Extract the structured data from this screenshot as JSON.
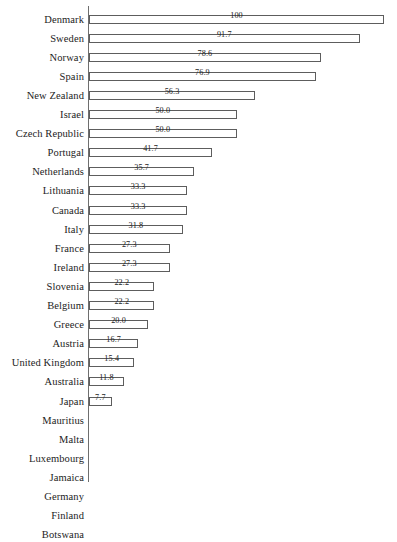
{
  "chart": {
    "type": "bar",
    "orientation": "horizontal",
    "background_color": "#ffffff",
    "bar_fill_color": "#ffffff",
    "bar_border_color": "#5d5d5d",
    "axis_color": "#6e6e6e",
    "text_color": "#1c1c1c"
  },
  "chart_data": {
    "type": "bar",
    "title": "",
    "subtitle": "",
    "xlabel": "",
    "ylabel": "",
    "xlim": [
      0,
      100
    ],
    "grid": false,
    "legend": "none",
    "orientation": "horizontal",
    "categories": [
      "Denmark",
      "Sweden",
      "Norway",
      "Spain",
      "New Zealand",
      "Israel",
      "Czech Republic",
      "Portugal",
      "Netherlands",
      "Lithuania",
      "Canada",
      "Italy",
      "France",
      "Ireland",
      "Slovenia",
      "Belgium",
      "Greece",
      "Austria",
      "United Kingdom",
      "Australia",
      "Japan",
      "Mauritius",
      "Malta",
      "Luxembourg",
      "Jamaica",
      "Germany",
      "Finland",
      "Botswana"
    ],
    "values": [
      100,
      91.7,
      78.6,
      76.9,
      56.3,
      50.0,
      50.0,
      41.7,
      35.7,
      33.3,
      33.3,
      31.8,
      27.3,
      27.3,
      22.2,
      22.2,
      20.0,
      16.7,
      15.4,
      11.8,
      7.7,
      0,
      0,
      0,
      0,
      0,
      0,
      0
    ],
    "data_labels": [
      "100",
      "91.7",
      "78.6",
      "76.9",
      "56.3",
      "50.0",
      "50.0",
      "41.7",
      "35.7",
      "33.3",
      "33.3",
      "31.8",
      "27.3",
      "27.3",
      "22.2",
      "22.2",
      "20.0",
      "16.7",
      "15.4",
      "11.8",
      "7.7",
      "",
      "",
      "",
      "",
      "",
      "",
      ""
    ]
  }
}
